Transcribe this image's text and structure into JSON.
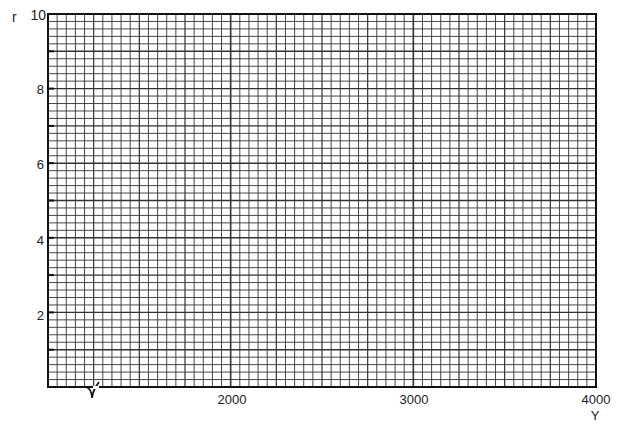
{
  "chart_data": {
    "type": "line",
    "title": "",
    "xlabel": "Y",
    "ylabel": "r",
    "xlim": [
      1000,
      4000
    ],
    "ylim": [
      0,
      10
    ],
    "x_ticks": [
      2000,
      3000,
      4000
    ],
    "x_tick_labels": [
      "2000",
      "3000",
      "4000"
    ],
    "y_ticks": [
      2,
      4,
      6,
      8,
      10
    ],
    "y_tick_labels": [
      "2",
      "4",
      "6",
      "8",
      "10"
    ],
    "grid": true,
    "grid_minor_x_step": 50,
    "grid_minor_y_step": 0.2,
    "axis_break_x": true,
    "series": [],
    "note": "Blank graph paper grid for plotting r versus Y"
  },
  "labels": {
    "ylabel": "r",
    "xlabel": "Y",
    "y10": "10",
    "y8": "8",
    "y6": "6",
    "y4": "4",
    "y2": "2",
    "x2000": "2000",
    "x3000": "3000",
    "x4000": "4000"
  },
  "colors": {
    "grid": "#333333",
    "axis": "#111111",
    "background": "#ffffff"
  }
}
